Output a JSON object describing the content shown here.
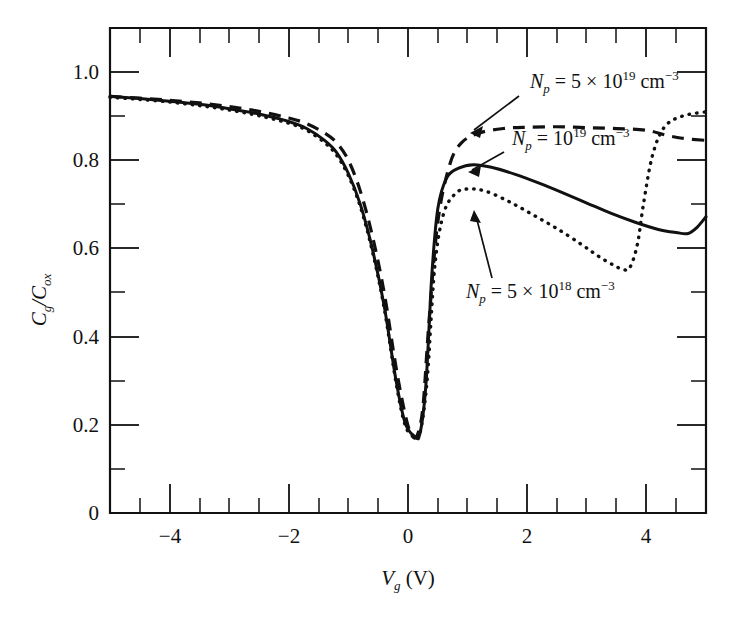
{
  "chart_data": {
    "type": "line",
    "title": "",
    "xlabel": "Vg (V)",
    "ylabel": "Cg/Cox",
    "xlim": [
      -5,
      5
    ],
    "ylim": [
      0,
      1.1
    ],
    "grid": false,
    "legend_position": "inline-annotations",
    "x_ticks": [
      -4,
      -2,
      0,
      2,
      4
    ],
    "x_tick_labels": [
      "−4",
      "−2",
      "0",
      "2",
      "4"
    ],
    "x_minor_step": 0.5,
    "y_ticks": [
      0,
      0.2,
      0.4,
      0.6,
      0.8,
      1.0
    ],
    "y_tick_labels": [
      "0",
      "0.2",
      "0.4",
      "0.6",
      "0.8",
      "1.0"
    ],
    "series": [
      {
        "name": "Np = 5 x 10^19 cm^-3",
        "style": "dashed",
        "x": [
          -5.0,
          -4.5,
          -4.0,
          -3.5,
          -3.0,
          -2.5,
          -2.0,
          -1.7,
          -1.4,
          -1.2,
          -1.0,
          -0.8,
          -0.6,
          -0.4,
          -0.2,
          -0.05,
          0.05,
          0.15,
          0.25,
          0.35,
          0.5,
          0.7,
          0.9,
          1.2,
          1.6,
          2.0,
          2.5,
          3.0,
          3.5,
          4.0,
          4.3,
          4.6,
          5.0
        ],
        "y": [
          0.945,
          0.941,
          0.936,
          0.93,
          0.922,
          0.911,
          0.896,
          0.883,
          0.862,
          0.84,
          0.8,
          0.73,
          0.63,
          0.5,
          0.33,
          0.225,
          0.18,
          0.175,
          0.24,
          0.43,
          0.66,
          0.79,
          0.84,
          0.862,
          0.872,
          0.875,
          0.876,
          0.874,
          0.872,
          0.868,
          0.858,
          0.85,
          0.845
        ]
      },
      {
        "name": "Np = 10^19 cm^-3",
        "style": "solid",
        "x": [
          -5.0,
          -4.5,
          -4.0,
          -3.5,
          -3.0,
          -2.5,
          -2.0,
          -1.7,
          -1.4,
          -1.2,
          -1.0,
          -0.8,
          -0.6,
          -0.4,
          -0.2,
          -0.05,
          0.1,
          0.2,
          0.3,
          0.4,
          0.5,
          0.65,
          0.85,
          1.1,
          1.4,
          1.8,
          2.2,
          2.6,
          3.0,
          3.4,
          3.8,
          4.2,
          4.5,
          4.7,
          4.85,
          5.0
        ],
        "y": [
          0.945,
          0.94,
          0.934,
          0.927,
          0.917,
          0.905,
          0.888,
          0.872,
          0.845,
          0.818,
          0.77,
          0.7,
          0.6,
          0.47,
          0.3,
          0.205,
          0.175,
          0.18,
          0.29,
          0.54,
          0.69,
          0.76,
          0.782,
          0.79,
          0.784,
          0.768,
          0.748,
          0.726,
          0.703,
          0.68,
          0.66,
          0.643,
          0.636,
          0.634,
          0.648,
          0.672
        ]
      },
      {
        "name": "Np = 5 x 10^18 cm^-3",
        "style": "dotted",
        "x": [
          -5.0,
          -4.5,
          -4.0,
          -3.5,
          -3.0,
          -2.5,
          -2.0,
          -1.7,
          -1.4,
          -1.2,
          -1.0,
          -0.8,
          -0.6,
          -0.4,
          -0.2,
          -0.05,
          0.1,
          0.2,
          0.32,
          0.45,
          0.6,
          0.8,
          1.0,
          1.3,
          1.7,
          2.1,
          2.5,
          2.9,
          3.2,
          3.45,
          3.6,
          3.72,
          3.85,
          3.95,
          4.1,
          4.3,
          4.6,
          5.0
        ],
        "y": [
          0.943,
          0.938,
          0.932,
          0.924,
          0.914,
          0.901,
          0.884,
          0.868,
          0.84,
          0.812,
          0.765,
          0.695,
          0.595,
          0.465,
          0.295,
          0.2,
          0.173,
          0.18,
          0.3,
          0.56,
          0.68,
          0.725,
          0.735,
          0.73,
          0.706,
          0.676,
          0.645,
          0.61,
          0.582,
          0.562,
          0.553,
          0.556,
          0.61,
          0.7,
          0.81,
          0.875,
          0.9,
          0.91
        ]
      }
    ],
    "annotations": [
      {
        "id": "annot-5e19",
        "text": "Np = 5 × 10^19 cm^-3",
        "parts": {
          "n": "N",
          "sub": "p",
          "eq": " = 5 × 10",
          "exp": "19",
          "unit": " cm",
          "unit_exp": "−3"
        },
        "label_x": 530,
        "label_y": 88,
        "arrow_from": [
          519,
          96
        ],
        "arrow_to": [
          470,
          133
        ]
      },
      {
        "id": "annot-1e19",
        "text": "Np = 10^19 cm^-3",
        "parts": {
          "n": "N",
          "sub": "p",
          "eq": " = 10",
          "exp": "19",
          "unit": " cm",
          "unit_exp": "−3"
        },
        "label_x": 512,
        "label_y": 145,
        "arrow_from": [
          504,
          152
        ],
        "arrow_to": [
          468,
          172
        ]
      },
      {
        "id": "annot-5e18",
        "text": "Np = 5 × 10^18 cm^-3",
        "parts": {
          "n": "N",
          "sub": "p",
          "eq": " = 5 × 10",
          "exp": "18",
          "unit": " cm",
          "unit_exp": "−3"
        },
        "label_x": 466,
        "label_y": 298,
        "arrow_from": [
          492,
          276
        ],
        "arrow_to": [
          474,
          212
        ]
      }
    ]
  },
  "axes": {
    "y_label_main": "C",
    "y_label_sub1": "g",
    "y_label_slash": "/C",
    "y_label_sub2": "ox",
    "x_label_main": "V",
    "x_label_sub": "g",
    "x_label_unit": " (V)"
  }
}
